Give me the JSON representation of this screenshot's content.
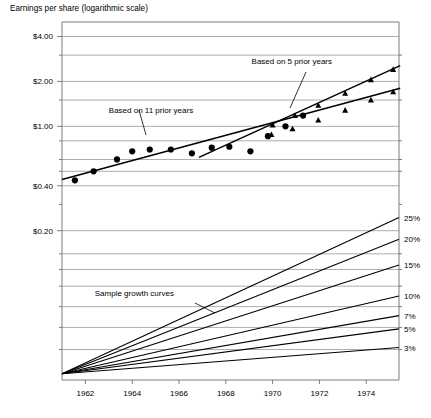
{
  "chart_data": {
    "type": "line",
    "title": "Earnings per share (logarithmic scale)",
    "ylabel": "Earnings per share (logarithmic scale)",
    "xlabel": "",
    "scale": "logarithmic",
    "grid": true,
    "legend_position": "none",
    "xlim": [
      1961,
      1975.4
    ],
    "ylim": [
      0.02,
      5.0
    ],
    "x_tick_labels": [
      "1962",
      "1964",
      "1966",
      "1968",
      "1970",
      "1972",
      "1974"
    ],
    "x_ticks": [
      1962,
      1964,
      1966,
      1968,
      1970,
      1972,
      1974
    ],
    "y_tick_labels": [
      "$4.00",
      "$2.00",
      "$1.00",
      "$0.40",
      "$0.20"
    ],
    "y_ticks": [
      4.0,
      2.0,
      1.0,
      0.4,
      0.2
    ],
    "y_gridlines": [
      4.0,
      3.0,
      2.0,
      1.5,
      1.0,
      0.8,
      0.6,
      0.5,
      0.4,
      0.2,
      0.14,
      0.11,
      0.085,
      0.062,
      0.045,
      0.032
    ],
    "series": [
      {
        "name": "Actual earnings per share",
        "marker": "circle",
        "points": [
          {
            "x": 1961.55,
            "y": 0.435
          },
          {
            "x": 1962.35,
            "y": 0.5
          },
          {
            "x": 1963.35,
            "y": 0.6
          },
          {
            "x": 1964.0,
            "y": 0.68
          },
          {
            "x": 1964.75,
            "y": 0.7
          },
          {
            "x": 1965.65,
            "y": 0.7
          },
          {
            "x": 1966.55,
            "y": 0.66
          },
          {
            "x": 1967.4,
            "y": 0.72
          },
          {
            "x": 1968.15,
            "y": 0.73
          },
          {
            "x": 1969.05,
            "y": 0.68
          },
          {
            "x": 1969.8,
            "y": 0.86
          },
          {
            "x": 1970.55,
            "y": 1.0
          },
          {
            "x": 1971.3,
            "y": 1.18
          }
        ]
      },
      {
        "name": "Based on 11 prior years",
        "marker": "triangle",
        "trend_from": {
          "x": 1961.0,
          "y": 0.44
        },
        "trend_to": {
          "x": 1975.45,
          "y": 1.8
        },
        "points": [
          {
            "x": 1969.95,
            "y": 0.88
          },
          {
            "x": 1970.85,
            "y": 0.96
          },
          {
            "x": 1971.95,
            "y": 1.1
          },
          {
            "x": 1973.1,
            "y": 1.28
          },
          {
            "x": 1974.2,
            "y": 1.5
          },
          {
            "x": 1975.15,
            "y": 1.7
          }
        ]
      },
      {
        "name": "Based on 5 prior years",
        "marker": "triangle",
        "trend_from": {
          "x": 1966.85,
          "y": 0.62
        },
        "trend_to": {
          "x": 1975.45,
          "y": 2.55
        },
        "points": [
          {
            "x": 1970.0,
            "y": 1.02
          },
          {
            "x": 1970.95,
            "y": 1.18
          },
          {
            "x": 1971.95,
            "y": 1.38
          },
          {
            "x": 1973.1,
            "y": 1.66
          },
          {
            "x": 1974.2,
            "y": 2.05
          },
          {
            "x": 1975.15,
            "y": 2.4
          }
        ]
      }
    ],
    "annotations": [
      {
        "text": "Based on 5 prior years",
        "x": 1969.1,
        "y": 2.6,
        "leader": true
      },
      {
        "text": "Based on 11 prior years",
        "x": 1963.0,
        "y": 1.22,
        "leader": true
      },
      {
        "text": "Sample growth curves",
        "x": 1962.4,
        "y": 0.073,
        "leader": true
      }
    ],
    "growth_curves": {
      "origin": {
        "x": 1961.0,
        "y": 0.022
      },
      "labels": [
        "25%",
        "20%",
        "15%",
        "10%",
        "7%",
        "5%",
        "3%"
      ],
      "rates": [
        25,
        20,
        15,
        10,
        7,
        5,
        3
      ],
      "end_values": [
        0.245,
        0.175,
        0.118,
        0.073,
        0.054,
        0.044,
        0.033
      ]
    }
  }
}
